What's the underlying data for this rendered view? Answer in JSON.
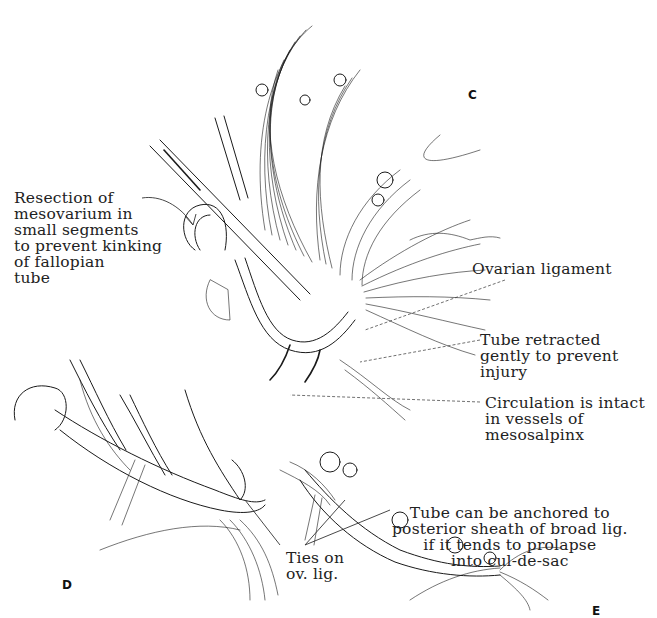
{
  "figure": {
    "panels": [
      {
        "id": "C",
        "letter": "C"
      },
      {
        "id": "D",
        "letter": "D"
      },
      {
        "id": "E",
        "letter": "E"
      }
    ],
    "labels": {
      "resection": "Resection of\nmesovarium in\nsmall segments\nto prevent kinking\nof fallopian\ntube",
      "ovarian_ligament": "Ovarian ligament",
      "tube_retracted": "Tube retracted\ngently to prevent\ninjury",
      "circulation": "Circulation is intact\nin vessels of\nmesosalpinx",
      "tube_anchored": "Tube can be anchored to\nposterior sheath of broad lig.\nif it tends to prolapse\ninto cul-de-sac",
      "ties": "Ties on\nov. lig."
    }
  }
}
